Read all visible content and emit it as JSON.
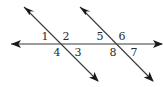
{
  "diagram": {
    "colors": {
      "line": "#3a3a3a",
      "arrow": "#1a1a1a",
      "label": "#2a2a2a",
      "background": "#ffffff"
    },
    "lines": [
      {
        "id": "horizontal",
        "x1": 11,
        "y1": 44,
        "x2": 162,
        "y2": 44
      },
      {
        "id": "transversal-left",
        "x1": 24,
        "y1": 7,
        "x2": 98,
        "y2": 81
      },
      {
        "id": "transversal-right",
        "x1": 80,
        "y1": 7,
        "x2": 153,
        "y2": 81
      }
    ],
    "intersections": [
      {
        "x": 61,
        "y": 44
      },
      {
        "x": 117,
        "y": 44
      }
    ],
    "angles": [
      {
        "label": "1",
        "x": 45,
        "y": 40
      },
      {
        "label": "2",
        "x": 66,
        "y": 40
      },
      {
        "label": "3",
        "x": 78,
        "y": 56
      },
      {
        "label": "4",
        "x": 57,
        "y": 56
      },
      {
        "label": "5",
        "x": 100,
        "y": 40
      },
      {
        "label": "6",
        "x": 122,
        "y": 40
      },
      {
        "label": "7",
        "x": 134,
        "y": 56
      },
      {
        "label": "8",
        "x": 113,
        "y": 56
      }
    ]
  }
}
